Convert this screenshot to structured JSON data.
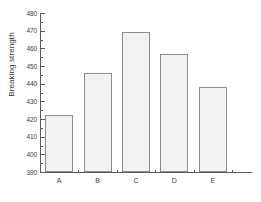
{
  "chart_data": {
    "type": "bar",
    "title": "",
    "xlabel": "",
    "ylabel": "Breaking strength",
    "categories": [
      "A",
      "B",
      "C",
      "D",
      "E"
    ],
    "values": [
      422.2,
      446.3,
      469.5,
      456.8,
      438.2
    ],
    "ylim": [
      390,
      480
    ],
    "xlim_note": "categorical",
    "ytick_labels": [
      "390",
      "400",
      "410",
      "420",
      "430",
      "440",
      "450",
      "460",
      "470",
      "480"
    ],
    "ytick_values": [
      390,
      400,
      410,
      420,
      430,
      440,
      450,
      460,
      470,
      480
    ],
    "ytick_step": 10,
    "yminor_ticks_per_interval": 1,
    "grid": false,
    "legend": null,
    "legend_position": "none",
    "series": [
      {
        "name": "Breaking strength",
        "values": [
          422.2,
          446.3,
          469.5,
          456.8,
          438.2
        ],
        "fill_color": "#f2f2f2",
        "edge_color": "#8c8c8c"
      }
    ],
    "axes_style": {
      "frame": "left-bottom",
      "tick_direction": "in",
      "background": "#ffffff",
      "axis_color": "#5a5a5a"
    }
  }
}
